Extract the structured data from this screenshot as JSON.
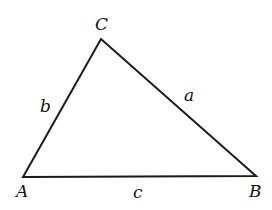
{
  "diagram": {
    "type": "triangle",
    "vertices": [
      {
        "name": "A",
        "label": "A",
        "x": 23,
        "y": 177
      },
      {
        "name": "B",
        "label": "B",
        "x": 256,
        "y": 176
      },
      {
        "name": "C",
        "label": "C",
        "x": 101,
        "y": 39
      }
    ],
    "sides": [
      {
        "name": "a",
        "label": "a",
        "between": [
          "B",
          "C"
        ]
      },
      {
        "name": "b",
        "label": "b",
        "between": [
          "A",
          "C"
        ]
      },
      {
        "name": "c",
        "label": "c",
        "between": [
          "A",
          "B"
        ]
      }
    ],
    "line_color": "#1a1a1a",
    "text_color": "#111111"
  }
}
